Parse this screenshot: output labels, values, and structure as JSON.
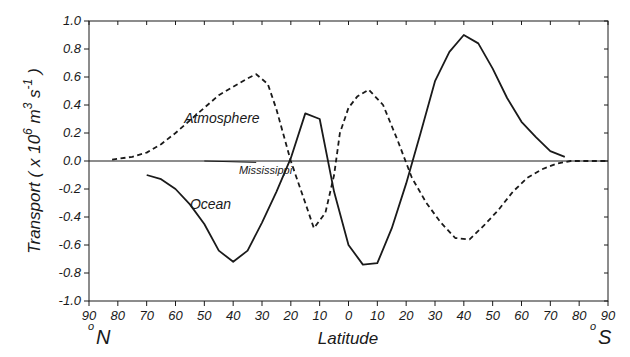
{
  "chart_data": {
    "type": "line",
    "title": "",
    "xlabel": "Latitude",
    "ylabel": "Transport ( x 10^6 m^3 s^-1 )",
    "ylabel_parts": {
      "prefix": "Transport ( x 10",
      "exp1": "6",
      "mid": " m",
      "exp2": "3",
      "mid2": " s",
      "exp3": "-1",
      "suffix": " )"
    },
    "xlim": [
      90,
      -90
    ],
    "ylim": [
      -1.0,
      1.0
    ],
    "x_tick_labels": [
      "90",
      "80",
      "70",
      "60",
      "50",
      "40",
      "30",
      "20",
      "10",
      "0",
      "10",
      "20",
      "30",
      "40",
      "50",
      "60",
      "70",
      "80",
      "90"
    ],
    "x_tick_values": [
      90,
      80,
      70,
      60,
      50,
      40,
      30,
      20,
      10,
      0,
      -10,
      -20,
      -30,
      -40,
      -50,
      -60,
      -70,
      -80,
      -90
    ],
    "y_tick_labels": [
      "1.0",
      "0.8",
      "0.6",
      "0.4",
      "0.2",
      "0.0",
      "-0.2",
      "-0.4",
      "-0.6",
      "-0.8",
      "-1.0"
    ],
    "y_tick_values": [
      1.0,
      0.8,
      0.6,
      0.4,
      0.2,
      0.0,
      -0.2,
      -0.4,
      -0.6,
      -0.8,
      -1.0
    ],
    "hemisphere_labels": {
      "north": "N",
      "south": "S",
      "degree": "o"
    },
    "grid": false,
    "legend": null,
    "x_convention": "positive = degrees North, negative = degrees South",
    "series": [
      {
        "name": "Ocean",
        "style": "solid",
        "x": [
          70,
          65,
          60,
          55,
          50,
          45,
          40,
          35,
          30,
          25,
          20,
          15,
          10,
          5,
          0,
          -5,
          -10,
          -15,
          -20,
          -25,
          -30,
          -35,
          -40,
          -45,
          -50,
          -55,
          -60,
          -65,
          -70,
          -75
        ],
        "values": [
          -0.1,
          -0.13,
          -0.2,
          -0.31,
          -0.45,
          -0.64,
          -0.72,
          -0.64,
          -0.44,
          -0.22,
          0.02,
          0.34,
          0.3,
          -0.22,
          -0.6,
          -0.74,
          -0.73,
          -0.48,
          -0.16,
          0.2,
          0.57,
          0.78,
          0.9,
          0.84,
          0.66,
          0.45,
          0.28,
          0.17,
          0.07,
          0.03
        ]
      },
      {
        "name": "Atmosphere",
        "style": "dashed",
        "x": [
          82,
          75,
          70,
          65,
          60,
          55,
          50,
          45,
          40,
          35,
          32,
          28,
          25,
          20,
          15,
          12,
          8,
          5,
          3,
          0,
          -3,
          -7,
          -12,
          -17,
          -22,
          -27,
          -32,
          -37,
          -42,
          -47,
          -52,
          -57,
          -62,
          -67,
          -72,
          -77,
          -90
        ],
        "values": [
          0.01,
          0.03,
          0.06,
          0.12,
          0.2,
          0.29,
          0.38,
          0.47,
          0.53,
          0.59,
          0.62,
          0.55,
          0.37,
          0.0,
          -0.3,
          -0.48,
          -0.37,
          -0.1,
          0.2,
          0.38,
          0.46,
          0.51,
          0.4,
          0.15,
          -0.12,
          -0.3,
          -0.44,
          -0.55,
          -0.56,
          -0.46,
          -0.35,
          -0.22,
          -0.12,
          -0.06,
          -0.02,
          0.0,
          0.0
        ]
      },
      {
        "name": "Mississippi",
        "style": "thin",
        "x": [
          50,
          32
        ],
        "values": [
          0.0,
          -0.01
        ]
      }
    ],
    "annotations": [
      {
        "text": "Atmosphere",
        "x": 57,
        "y": 0.27
      },
      {
        "text": "Mississippi",
        "x": 38,
        "y": -0.09
      },
      {
        "text": "Ocean",
        "x": 55,
        "y": -0.34
      }
    ]
  },
  "colors": {
    "line": "#1a1a1a",
    "background": "#ffffff"
  }
}
